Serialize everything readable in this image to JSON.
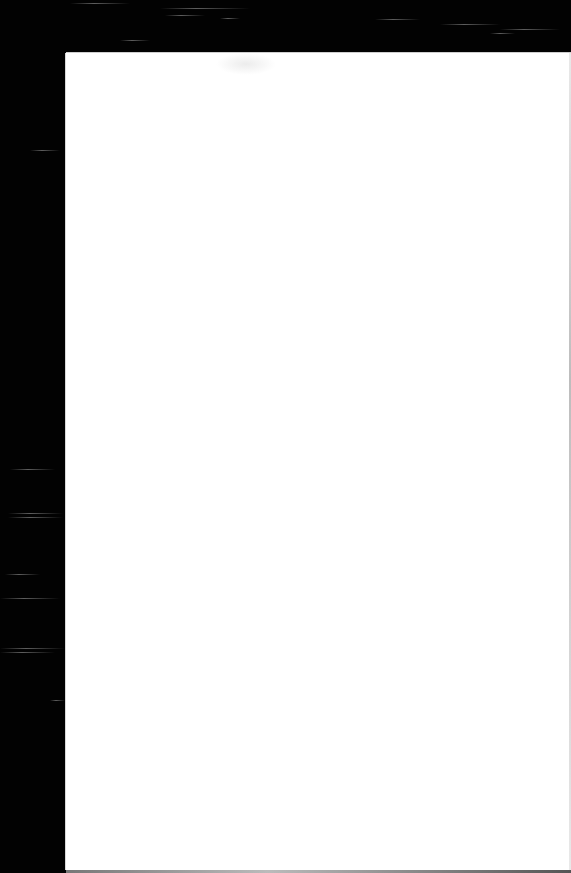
{
  "scene": {
    "description": "Blank white sheet of paper on a black background",
    "background_color": "#020202",
    "sheet_color": "#ffffff"
  },
  "sheet": {
    "text": ""
  }
}
